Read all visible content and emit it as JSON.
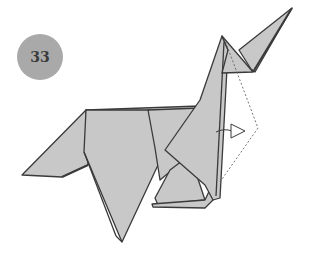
{
  "diagram": {
    "step_number": "33",
    "colors": {
      "paper": "#c8c8c8",
      "edge": "#3a3a3a",
      "badge": "#a9a9a9",
      "badge_text": "#3a3a3a"
    },
    "annotations": [
      {
        "type": "dotted-fold-line",
        "description": "valley fold guide from head to chest"
      },
      {
        "type": "hollow-arrow",
        "description": "arrow pointing right indicating fold direction"
      }
    ]
  }
}
